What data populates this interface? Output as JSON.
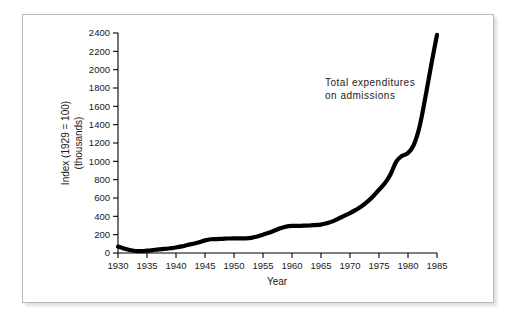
{
  "figure": {
    "background_color": "#ffffff",
    "frame_color": "#b9b9b9",
    "line_color": "#000000"
  },
  "annotations": {
    "line1": "Total  expenditures",
    "line2": "on  admissions"
  },
  "axes": {
    "x_title": "Year",
    "y_title_line1": "Index (1929 = 100)",
    "y_title_line2": "(thousands)"
  },
  "chart_data": {
    "type": "line",
    "title": "",
    "xlabel": "Year",
    "ylabel": "Index (1929 = 100) (thousands)",
    "xlim": [
      1930,
      1985
    ],
    "ylim": [
      0,
      2400
    ],
    "grid": false,
    "legend": "none",
    "annotation": "Total expenditures on admissions",
    "xticks": [
      1930,
      1935,
      1940,
      1945,
      1950,
      1955,
      1960,
      1965,
      1970,
      1975,
      1980,
      1985
    ],
    "xtick_labels": [
      "1930",
      "1935",
      "1940",
      "1945",
      "1950",
      "1955",
      "1960",
      "1965",
      "1970",
      "1975",
      "1980",
      "1985"
    ],
    "yticks": [
      0,
      200,
      400,
      600,
      800,
      1000,
      1200,
      1400,
      1600,
      1800,
      2000,
      2200,
      2400
    ],
    "ytick_labels": [
      "0",
      "200",
      "400",
      "600",
      "800",
      "1000",
      "1200",
      "1400",
      "1600",
      "1800",
      "2000",
      "2200",
      "2400"
    ],
    "series": [
      {
        "name": "Total expenditures on admissions",
        "x": [
          1930,
          1931,
          1932,
          1933,
          1934,
          1935,
          1936,
          1937,
          1938,
          1939,
          1940,
          1941,
          1942,
          1943,
          1944,
          1945,
          1946,
          1947,
          1948,
          1949,
          1950,
          1951,
          1952,
          1953,
          1954,
          1955,
          1956,
          1957,
          1958,
          1959,
          1960,
          1961,
          1962,
          1963,
          1964,
          1965,
          1966,
          1967,
          1968,
          1969,
          1970,
          1971,
          1972,
          1973,
          1974,
          1975,
          1976,
          1977,
          1978,
          1979,
          1980,
          1981,
          1982,
          1983,
          1984,
          1985
        ],
        "values": [
          70,
          50,
          32,
          22,
          20,
          25,
          32,
          40,
          45,
          52,
          60,
          72,
          88,
          100,
          118,
          138,
          150,
          152,
          155,
          158,
          160,
          160,
          160,
          165,
          180,
          200,
          220,
          245,
          270,
          288,
          295,
          296,
          298,
          300,
          305,
          310,
          325,
          345,
          375,
          405,
          435,
          470,
          510,
          560,
          620,
          690,
          760,
          860,
          1000,
          1060,
          1090,
          1180,
          1380,
          1700,
          2050,
          2380
        ]
      }
    ]
  }
}
